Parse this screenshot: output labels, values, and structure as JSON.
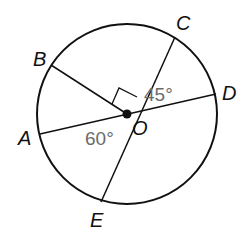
{
  "diagram": {
    "type": "circle-geometry",
    "center_label": "O",
    "points": [
      {
        "label": "A"
      },
      {
        "label": "B"
      },
      {
        "label": "C"
      },
      {
        "label": "D"
      },
      {
        "label": "E"
      }
    ],
    "angles": [
      {
        "label": "45°",
        "between": "C-O-D"
      },
      {
        "label": "60°",
        "between": "A-O-E"
      },
      {
        "label": "right angle",
        "between": "B-O-C"
      }
    ],
    "colors": {
      "stroke": "#111111",
      "angle_text": "#6b6b6b"
    }
  }
}
